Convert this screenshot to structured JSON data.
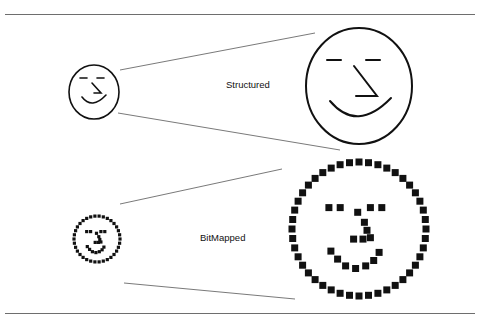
{
  "labels": {
    "structured": "Structured",
    "bitmapped": "BitMapped"
  },
  "colors": {
    "stroke": "#111111",
    "zoom_line": "#6a6a6a",
    "rule": "#6e6e6e"
  },
  "figure": {
    "structured_small": {
      "cx": 94,
      "cy": 92,
      "rx": 25,
      "ry": 27
    },
    "structured_large": {
      "cx": 359,
      "cy": 86,
      "rx": 53,
      "ry": 58
    },
    "bitmap_small": {
      "cx": 97,
      "cy": 239,
      "r": 23,
      "dot": 3.2
    },
    "bitmap_large": {
      "cx": 359,
      "cy": 229,
      "r": 67,
      "dot": 7
    }
  }
}
